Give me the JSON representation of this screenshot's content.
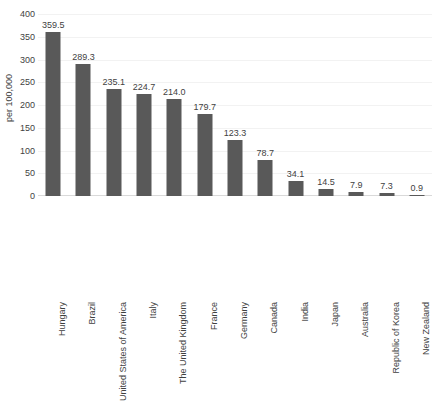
{
  "chart_data": {
    "type": "bar",
    "title": "",
    "xlabel": "",
    "ylabel": "per 100,000",
    "ylim": [
      0,
      400
    ],
    "ytick_step": 50,
    "yticks": [
      0,
      50,
      100,
      150,
      200,
      250,
      300,
      350,
      400
    ],
    "grid": true,
    "legend": null,
    "orientation": "vertical",
    "bar_color": "#595959",
    "categories": [
      "Hungary",
      "Brazil",
      "United States of America",
      "Italy",
      "The United Kingdom",
      "France",
      "Germany",
      "Canada",
      "India",
      "Japan",
      "Australia",
      "Republic of Korea",
      "New Zealand"
    ],
    "values": [
      359.5,
      289.3,
      235.1,
      224.7,
      214.0,
      179.7,
      123.3,
      78.7,
      34.1,
      14.5,
      7.9,
      7.3,
      0.9
    ],
    "data_labels": [
      "359.5",
      "289.3",
      "235.1",
      "224.7",
      "214.0",
      "179.7",
      "123.3",
      "78.7",
      "34.1",
      "14.5",
      "7.9",
      "7.3",
      "0.9"
    ]
  }
}
